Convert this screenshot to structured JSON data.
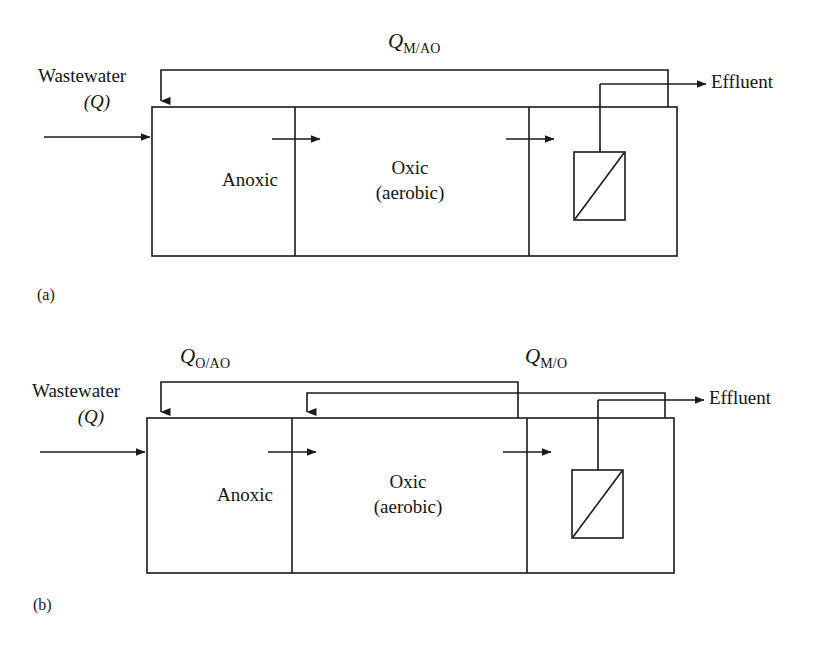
{
  "figure": {
    "type": "process-flow-diagram",
    "line_color": "#1a1a1a",
    "background_color": "#ffffff"
  },
  "panels": [
    {
      "caption": "(a)",
      "inlet_label_line1": "Wastewater",
      "inlet_label_line2": "(Q)",
      "outlet_label": "Effluent",
      "zone1_label": "Anoxic",
      "zone2_label_line1": "Oxic",
      "zone2_label_line2": "(aerobic)",
      "recycle_streams": [
        {
          "symbol": "Q",
          "subscript": "M/AO"
        }
      ]
    },
    {
      "caption": "(b)",
      "inlet_label_line1": "Wastewater",
      "inlet_label_line2": "(Q)",
      "outlet_label": "Effluent",
      "zone1_label": "Anoxic",
      "zone2_label_line1": "Oxic",
      "zone2_label_line2": "(aerobic)",
      "recycle_streams": [
        {
          "symbol": "Q",
          "subscript": "O/AO"
        },
        {
          "symbol": "Q",
          "subscript": "M/O"
        }
      ]
    }
  ],
  "elements": {
    "membrane_module": "membrane-module",
    "arrow": "flow-arrow"
  }
}
